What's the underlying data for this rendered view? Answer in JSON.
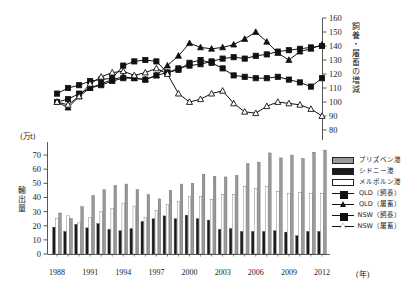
{
  "units": {
    "bar_unit": "(万t)",
    "x_unit": "(年)"
  },
  "axes": {
    "left_title": "輸出量",
    "right_title": "飼養・屠畜の増減",
    "left_ticks": [
      "0",
      "10",
      "20",
      "30",
      "40",
      "50",
      "60",
      "70"
    ],
    "right_ticks": [
      "80",
      "90",
      "100",
      "110",
      "120",
      "130",
      "140",
      "150",
      "160"
    ],
    "x_ticks": [
      "1988",
      "1991",
      "1994",
      "1997",
      "2000",
      "2003",
      "2006",
      "2009",
      "2012"
    ]
  },
  "legend": [
    {
      "label": "ブリズベン港",
      "kind": "swatch",
      "fill": "#9a9a9a"
    },
    {
      "label": "シドニー港",
      "kind": "swatch",
      "fill": "#1a1a1a"
    },
    {
      "label": "メルボルン港",
      "kind": "swatch",
      "fill": "#ffffff"
    },
    {
      "label": "QLD（飼養）",
      "kind": "line-square-filled",
      "fill": "#111111"
    },
    {
      "label": "QLD（屠畜）",
      "kind": "line-triangle-filled",
      "fill": "#111111"
    },
    {
      "label": "NSW（飼養）",
      "kind": "line-square-open",
      "fill": "#111111"
    },
    {
      "label": "NSW（屠畜）",
      "kind": "line-triangle-open",
      "fill": "#ffffff"
    }
  ],
  "colors": {
    "brisbane": "#9a9a9a",
    "sydney": "#1a1a1a",
    "melbourne": "#ffffff",
    "axis": "#444444",
    "line": "#111111"
  },
  "chart_data": [
    {
      "type": "line",
      "title": "",
      "xlabel": "",
      "ylabel": "飼養・屠畜の増減",
      "ylim": [
        80,
        160
      ],
      "x": [
        1988,
        1989,
        1990,
        1991,
        1992,
        1993,
        1994,
        1995,
        1996,
        1997,
        1998,
        1999,
        2000,
        2001,
        2002,
        2003,
        2004,
        2005,
        2006,
        2007,
        2008,
        2009,
        2010,
        2011,
        2012
      ],
      "grid": false,
      "legend_position": "right",
      "series": [
        {
          "name": "QLD（飼養）",
          "marker": "square-filled",
          "values": [
            100,
            102,
            106,
            110,
            112,
            115,
            117,
            117,
            116,
            119,
            121,
            124,
            126,
            127,
            129,
            131,
            132,
            131,
            133,
            134,
            136,
            137,
            138,
            139,
            140
          ]
        },
        {
          "name": "QLD（屠畜）",
          "marker": "triangle-filled",
          "values": [
            100,
            96,
            104,
            110,
            113,
            116,
            118,
            117,
            116,
            119,
            126,
            133,
            142,
            139,
            138,
            139,
            141,
            145,
            150,
            143,
            135,
            130,
            136,
            138,
            141
          ]
        },
        {
          "name": "NSW（飼養）",
          "marker": "square-open",
          "values": [
            106,
            110,
            112,
            115,
            116,
            117,
            126,
            129,
            130,
            129,
            121,
            123,
            128,
            130,
            128,
            124,
            119,
            118,
            117,
            117,
            118,
            116,
            114,
            111,
            117
          ]
        },
        {
          "name": "NSW（屠畜）",
          "marker": "triangle-open",
          "values": [
            100,
            98,
            104,
            113,
            118,
            121,
            122,
            119,
            121,
            124,
            120,
            106,
            100,
            102,
            106,
            108,
            99,
            93,
            92,
            97,
            100,
            99,
            98,
            95,
            90
          ]
        }
      ]
    },
    {
      "type": "bar",
      "title": "",
      "xlabel": "(年)",
      "ylabel": "輸出量",
      "ylim": [
        0,
        75
      ],
      "grid": false,
      "legend_position": "right",
      "categories": [
        1988,
        1989,
        1990,
        1991,
        1992,
        1993,
        1994,
        1995,
        1996,
        1997,
        1998,
        1999,
        2000,
        2001,
        2002,
        2003,
        2004,
        2005,
        2006,
        2007,
        2008,
        2009,
        2010,
        2011,
        2012
      ],
      "series": [
        {
          "name": "シドニー港",
          "fill": "#1a1a1a",
          "values": [
            19,
            16,
            21,
            18.5,
            21.5,
            17.5,
            16.5,
            18,
            23,
            25,
            27,
            25,
            27.5,
            25,
            24,
            17.5,
            18,
            16,
            16,
            16,
            16.5,
            15.5,
            13,
            16,
            16
          ]
        },
        {
          "name": "メルボルン港",
          "fill": "#ffffff",
          "values": [
            25,
            27,
            22,
            26,
            30,
            32,
            36,
            34,
            26,
            31,
            35,
            37,
            40.5,
            40.5,
            38.5,
            42,
            42,
            48,
            46.5,
            48,
            44,
            43,
            43.5,
            43,
            43
          ]
        },
        {
          "name": "ブリズベン港",
          "fill": "#9a9a9a",
          "values": [
            29,
            25,
            33.5,
            41.5,
            45.5,
            48.5,
            49.5,
            45.5,
            42,
            39,
            45,
            49.5,
            50,
            56.5,
            55,
            54.5,
            55.5,
            64,
            65,
            71.5,
            68,
            70,
            67.5,
            72,
            73.5
          ]
        }
      ]
    }
  ]
}
